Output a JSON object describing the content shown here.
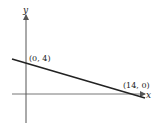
{
  "diagram": {
    "type": "coordinate-graph",
    "axes": {
      "x_label": "x",
      "y_label": "y"
    },
    "line": {
      "points": [
        {
          "x": 0,
          "y": 4,
          "label": "(0, 4)"
        },
        {
          "x": 14,
          "y": 0,
          "label": "(14, 0)"
        }
      ]
    },
    "colors": {
      "axis": "#555555",
      "line": "#222222"
    }
  }
}
